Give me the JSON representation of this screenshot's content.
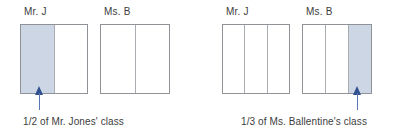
{
  "figure": {
    "background_color": "#ffffff",
    "shade_color": "#ccd6e4",
    "outline_color": "#8f9296",
    "divider_color": "#a9acb0",
    "arrow_color": "#31508f",
    "text_color": "#3d3d3d"
  },
  "comparisons": [
    {
      "id": "left",
      "models": [
        {
          "label": "Mr. J",
          "parts": 2,
          "shaded_parts": 1,
          "shaded_index": 0,
          "fraction": "1/2"
        },
        {
          "label": "Ms. B",
          "parts": 2,
          "shaded_parts": 0,
          "shaded_index": -1,
          "fraction": ""
        }
      ],
      "caption": "1/2 of Mr. Jones' class",
      "pointer_target": "Mr. J first part"
    },
    {
      "id": "right",
      "models": [
        {
          "label": "Mr. J",
          "parts": 3,
          "shaded_parts": 0,
          "shaded_index": -1,
          "fraction": ""
        },
        {
          "label": "Ms. B",
          "parts": 3,
          "shaded_parts": 1,
          "shaded_index": 2,
          "fraction": "1/3"
        }
      ],
      "caption": "1/3 of Ms. Ballentine's class",
      "pointer_target": "Ms. B third part"
    }
  ]
}
